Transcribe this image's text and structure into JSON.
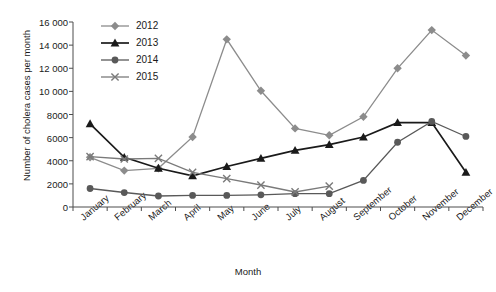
{
  "chart_data": {
    "type": "line",
    "title": "",
    "xlabel": "Month",
    "ylabel": "Number of cholera cases per month",
    "categories": [
      "January",
      "February",
      "March",
      "April",
      "May",
      "June",
      "July",
      "August",
      "September",
      "October",
      "November",
      "December"
    ],
    "ylim": [
      0,
      16000
    ],
    "ytick_labels": [
      "0",
      "2000",
      "4000",
      "6000",
      "8000",
      "10 000",
      "12 000",
      "14 000",
      "16 000"
    ],
    "ytick_values": [
      0,
      2000,
      4000,
      6000,
      8000,
      10000,
      12000,
      14000,
      16000
    ],
    "grid": false,
    "legend_position": "top-left",
    "series": [
      {
        "name": "2012",
        "marker": "diamond",
        "color": "#8c8c8c",
        "values": [
          4300,
          3150,
          3350,
          6050,
          14500,
          10050,
          6800,
          6200,
          7800,
          12000,
          15300,
          13100
        ]
      },
      {
        "name": "2013",
        "marker": "triangle",
        "color": "#1a1a1a",
        "values": [
          7200,
          4300,
          3350,
          2700,
          3500,
          4200,
          4900,
          5400,
          6050,
          7300,
          7300,
          3000
        ]
      },
      {
        "name": "2014",
        "marker": "circle",
        "color": "#595959",
        "values": [
          1600,
          1250,
          950,
          1000,
          1000,
          1050,
          1150,
          1150,
          2300,
          5600,
          7400,
          6100
        ]
      },
      {
        "name": "2015",
        "marker": "cross",
        "color": "#7a7a7a",
        "values": [
          4350,
          4150,
          4200,
          3000,
          2450,
          1900,
          1300,
          1800,
          null,
          null,
          null,
          null
        ]
      }
    ]
  }
}
